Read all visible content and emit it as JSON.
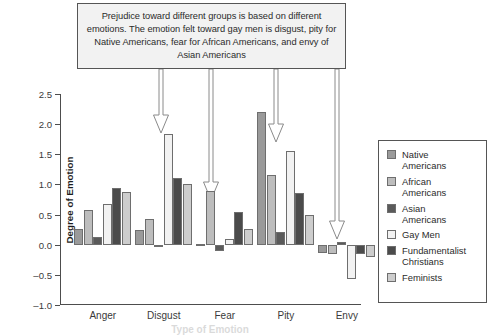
{
  "callout": {
    "text": "Prejudice toward different groups is based on different emotions. The emotion felt toward gay men is disgust, pity for Native Americans, fear for African Americans, and envy of Asian Americans"
  },
  "chart_data": {
    "type": "bar",
    "title": "",
    "xlabel": "Type of Emotion",
    "ylabel": "Degree of Emotion",
    "ylim": [
      -1.0,
      2.5
    ],
    "yticks": [
      "2.5",
      "2.0",
      "1.5",
      "1.0",
      "0.5",
      "0.0",
      "–0.5",
      "–1.0"
    ],
    "ytick_values": [
      2.5,
      2.0,
      1.5,
      1.0,
      0.5,
      0.0,
      -0.5,
      -1.0
    ],
    "grid": false,
    "legend_position": "right",
    "categories": [
      "Anger",
      "Disgust",
      "Fear",
      "Pity",
      "Envy"
    ],
    "series": [
      {
        "name": "Native Americans",
        "color": "#9a9a9a",
        "values": [
          0.26,
          0.25,
          0.02,
          2.2,
          -0.14
        ]
      },
      {
        "name": "African Americans",
        "color": "#bdbdbd",
        "values": [
          0.58,
          0.42,
          0.89,
          1.15,
          -0.15
        ]
      },
      {
        "name": "Asian Americans",
        "color": "#5a5a5a",
        "values": [
          0.13,
          0.0,
          -0.1,
          0.21,
          0.04
        ]
      },
      {
        "name": "Gay Men",
        "color": "#f2f2f2",
        "values": [
          0.67,
          1.84,
          0.1,
          1.55,
          -0.57
        ]
      },
      {
        "name": "Fundamentalist Christians",
        "color": "#4b4b4b",
        "values": [
          0.94,
          1.11,
          0.54,
          0.86,
          -0.16
        ]
      },
      {
        "name": "Feminists",
        "color": "#cdcdcd",
        "values": [
          0.87,
          1.01,
          0.26,
          0.5,
          -0.2
        ]
      }
    ],
    "annotations": [
      {
        "name": "arrow-to-disgust-gay-men",
        "target": "Disgust / Gay Men"
      },
      {
        "name": "arrow-to-fear-african",
        "target": "Fear / African Americans"
      },
      {
        "name": "arrow-to-pity-native",
        "target": "Pity / Native Americans"
      },
      {
        "name": "arrow-to-envy-asian",
        "target": "Envy / Asian Americans"
      }
    ]
  },
  "legend": {
    "items": [
      {
        "label": "Native\nAmericans"
      },
      {
        "label": "African\nAmericans"
      },
      {
        "label": "Asian\nAmericans"
      },
      {
        "label": "Gay Men"
      },
      {
        "label": "Fundamentalist\nChristians"
      },
      {
        "label": "Feminists"
      }
    ]
  }
}
